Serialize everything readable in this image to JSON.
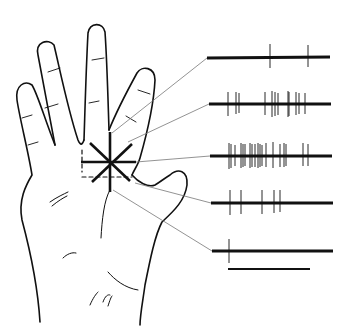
{
  "figure": {
    "colors": {
      "ink": "#111111",
      "leader": "#777777",
      "background": "#ffffff"
    },
    "stimulus": {
      "center": [
        110,
        162
      ],
      "arms": 8
    },
    "traces": [
      {
        "id": 1,
        "y": 58,
        "x_start": 207,
        "x_end": 330,
        "anchor": [
          112,
          133
        ],
        "spikes": [
          270,
          308
        ]
      },
      {
        "id": 2,
        "y": 104,
        "x_start": 209,
        "x_end": 331,
        "anchor": [
          128,
          142
        ],
        "spikes": [
          228,
          236,
          239,
          265,
          272,
          275,
          278,
          288,
          289,
          296,
          299,
          305
        ]
      },
      {
        "id": 3,
        "y": 156,
        "x_start": 210,
        "x_end": 332,
        "anchor": [
          136,
          162
        ],
        "spikes": [
          229,
          231,
          235,
          241,
          243,
          245,
          250,
          252,
          255,
          258,
          260,
          262,
          266,
          273,
          280,
          284,
          286,
          303,
          308
        ]
      },
      {
        "id": 4,
        "y": 203,
        "x_start": 211,
        "x_end": 333,
        "anchor": [
          135,
          183
        ],
        "spikes": [
          230,
          241,
          262,
          274,
          280
        ]
      },
      {
        "id": 5,
        "y": 251,
        "x_start": 212,
        "x_end": 333,
        "anchor": [
          113,
          190
        ],
        "spikes": [
          229
        ]
      }
    ],
    "scale_bar": {
      "x1": 228,
      "x2": 310,
      "y": 269
    }
  }
}
